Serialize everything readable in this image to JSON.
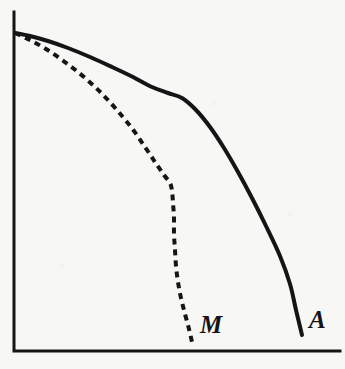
{
  "figure": {
    "background_color": "#f7f7f5",
    "ink_color": "#151515",
    "width": 345,
    "height": 369
  },
  "axes": {
    "name": "plot-axes",
    "color": "#151515",
    "stroke_width": 3,
    "origin": {
      "x": 14,
      "y": 351
    },
    "y_axis_top": {
      "x": 14,
      "y": 12
    },
    "x_axis_right": {
      "x": 340,
      "y": 351
    },
    "x_tick_labels": [],
    "y_tick_labels": [],
    "xlabel": "",
    "ylabel": "",
    "grid": false
  },
  "labels": {
    "curve_a": "A",
    "curve_m": "M"
  },
  "chart_data": {
    "type": "line",
    "title": "",
    "subtitle": "",
    "xlabel": "",
    "ylabel": "",
    "xlim": [
      14,
      340
    ],
    "ylim": [
      351,
      12
    ],
    "grid": false,
    "legend_position": "inline-end-of-curve",
    "axis_tick_labels": {
      "x": [],
      "y": []
    },
    "annotations": [
      {
        "text": "A",
        "x": 316,
        "y": 325,
        "style": "italic-serif",
        "anchor": "end-of-solid-curve"
      },
      {
        "text": "M",
        "x": 208,
        "y": 330,
        "style": "italic-serif",
        "anchor": "end-of-dashed-curve"
      }
    ],
    "series": [
      {
        "name": "A",
        "label": "A",
        "style": "solid",
        "color": "#151515",
        "stroke_width": 4,
        "points": [
          [
            15,
            33
          ],
          [
            30,
            36
          ],
          [
            48,
            41
          ],
          [
            68,
            48
          ],
          [
            90,
            57
          ],
          [
            112,
            67
          ],
          [
            133,
            77
          ],
          [
            152,
            87
          ],
          [
            168,
            93
          ],
          [
            182,
            98
          ],
          [
            196,
            110
          ],
          [
            210,
            127
          ],
          [
            224,
            148
          ],
          [
            238,
            172
          ],
          [
            252,
            198
          ],
          [
            266,
            226
          ],
          [
            280,
            256
          ],
          [
            290,
            284
          ],
          [
            296,
            310
          ],
          [
            302,
            335
          ]
        ]
      },
      {
        "name": "M",
        "label": "M",
        "style": "dashed",
        "color": "#151515",
        "stroke_width": 4,
        "dash_on": 6,
        "dash_off": 5,
        "points": [
          [
            15,
            33
          ],
          [
            30,
            40
          ],
          [
            46,
            49
          ],
          [
            62,
            60
          ],
          [
            78,
            72
          ],
          [
            94,
            86
          ],
          [
            108,
            100
          ],
          [
            122,
            116
          ],
          [
            134,
            131
          ],
          [
            145,
            147
          ],
          [
            155,
            162
          ],
          [
            164,
            175
          ],
          [
            170,
            183
          ],
          [
            172,
            191
          ],
          [
            173,
            203
          ],
          [
            174,
            218
          ],
          [
            174,
            234
          ],
          [
            175,
            250
          ],
          [
            176,
            266
          ],
          [
            178,
            282
          ],
          [
            181,
            298
          ],
          [
            185,
            314
          ],
          [
            189,
            329
          ],
          [
            192,
            342
          ]
        ]
      }
    ]
  }
}
